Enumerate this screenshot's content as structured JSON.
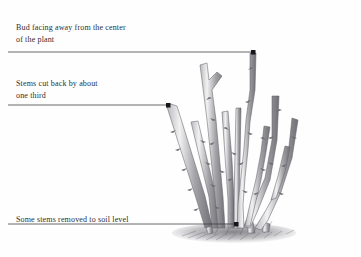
{
  "figure": {
    "kind": "botanical-pruning-illustration",
    "background_color": "#fefefe",
    "ink_color": "#2e2e33",
    "stem_color": "#8c8c90"
  },
  "annotations": [
    {
      "id": "bud",
      "text": "Bud facing away from the center\nof the plant",
      "leader": {
        "x1": 8,
        "y1": 52,
        "x2": 253,
        "y2": 52,
        "dot_x": 253,
        "dot_y": 52
      }
    },
    {
      "id": "stems",
      "text": "Stems cut back by about\none third",
      "leader": {
        "x1": 8,
        "y1": 105,
        "x2": 168,
        "y2": 105,
        "dot_x": 168,
        "dot_y": 105
      }
    },
    {
      "id": "soil",
      "text": "Some stems removed to soil level",
      "leader": {
        "x1": 8,
        "y1": 224,
        "x2": 236,
        "y2": 224,
        "dot_x": 236,
        "dot_y": 224
      }
    }
  ]
}
